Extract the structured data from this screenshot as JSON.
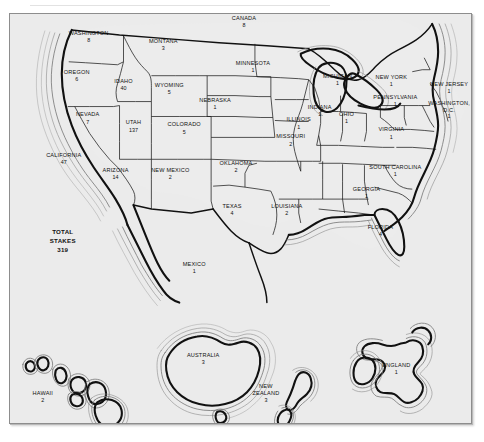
{
  "figure": {
    "type": "map",
    "region_fill": "#ececec",
    "frame_background": "#ebebeb",
    "outline_color": "#111111",
    "total": {
      "line1": "TOTAL",
      "line2": "STAKES",
      "value": "319"
    }
  },
  "regions": [
    {
      "name": "WASHINGTON",
      "value": "8",
      "x": 88,
      "y": 34,
      "lines": 1
    },
    {
      "name": "OREGON",
      "value": "6",
      "x": 76,
      "y": 73,
      "lines": 1
    },
    {
      "name": "IDAHO",
      "value": "40",
      "x": 123,
      "y": 82,
      "lines": 1
    },
    {
      "name": "MONTANA",
      "value": "3",
      "x": 163,
      "y": 42,
      "lines": 1
    },
    {
      "name": "WYOMING",
      "value": "5",
      "x": 169,
      "y": 86,
      "lines": 1
    },
    {
      "name": "NEVADA",
      "value": "7",
      "x": 87,
      "y": 116,
      "lines": 1
    },
    {
      "name": "UTAH",
      "value": "137",
      "x": 133,
      "y": 124,
      "lines": 1
    },
    {
      "name": "COLORADO",
      "value": "5",
      "x": 184,
      "y": 126,
      "lines": 1
    },
    {
      "name": "CALIFORNIA",
      "value": "47",
      "x": 63,
      "y": 157,
      "lines": 1
    },
    {
      "name": "ARIZONA",
      "value": "14",
      "x": 115,
      "y": 172,
      "lines": 1
    },
    {
      "name": "NEW MEXICO",
      "value": "2",
      "x": 170,
      "y": 172,
      "lines": 1
    },
    {
      "name": "NEBRASKA",
      "value": "1",
      "x": 215,
      "y": 101,
      "lines": 1
    },
    {
      "name": "OKLAHOMA",
      "value": "2",
      "x": 236,
      "y": 165,
      "lines": 1
    },
    {
      "name": "TEXAS",
      "value": "4",
      "x": 232,
      "y": 208,
      "lines": 1
    },
    {
      "name": "MINNESOTA",
      "value": "1",
      "x": 253,
      "y": 64,
      "lines": 1
    },
    {
      "name": "MISSOURI",
      "value": "2",
      "x": 291,
      "y": 138,
      "lines": 1
    },
    {
      "name": "ILLINOIS",
      "value": "1",
      "x": 299,
      "y": 121,
      "lines": 1
    },
    {
      "name": "INDIANA",
      "value": "1",
      "x": 320,
      "y": 108,
      "lines": 1
    },
    {
      "name": "OHIO",
      "value": "1",
      "x": 347,
      "y": 115,
      "lines": 1
    },
    {
      "name": "MICHIGAN",
      "value": "1",
      "x": 338,
      "y": 77,
      "lines": 1
    },
    {
      "name": "LOUISIANA",
      "value": "2",
      "x": 287,
      "y": 208,
      "lines": 1
    },
    {
      "name": "NEW YORK",
      "value": "1",
      "x": 392,
      "y": 78,
      "lines": 1
    },
    {
      "name": "PENNSYLVANIA",
      "value": "1",
      "x": 396,
      "y": 98,
      "lines": 1
    },
    {
      "name": "NEW JERSEY",
      "value": "1",
      "x": 450,
      "y": 85,
      "lines": 1
    },
    {
      "name": "VIRGINIA",
      "value": "1",
      "x": 392,
      "y": 131,
      "lines": 1
    },
    {
      "name": "SOUTH CAROLINA",
      "value": "1",
      "x": 396,
      "y": 169,
      "lines": 1
    },
    {
      "name": "GEORGIA",
      "value": "1",
      "x": 367,
      "y": 191,
      "lines": 1
    },
    {
      "name": "FLORIDA",
      "value": "4",
      "x": 381,
      "y": 229,
      "lines": 1
    },
    {
      "name": "CANADA",
      "value": "8",
      "x": 244,
      "y": 19,
      "lines": 1
    },
    {
      "name": "MEXICO",
      "value": "1",
      "x": 194,
      "y": 266,
      "lines": 1
    },
    {
      "name": "HAWAII",
      "value": "2",
      "x": 42,
      "y": 396,
      "lines": 1
    },
    {
      "name": "AUSTRALIA",
      "value": "3",
      "x": 203,
      "y": 358,
      "lines": 1
    },
    {
      "name": "ENGLAND",
      "value": "1",
      "x": 397,
      "y": 368,
      "lines": 1
    }
  ],
  "multiline_regions": [
    {
      "name": "WASHINGTON, D.C.",
      "value": "1",
      "line1": "WASHINGTON,",
      "line2": "D.C.",
      "x": 450,
      "y": 104
    },
    {
      "name": "NEW ZEALAND",
      "value": "3",
      "line1": "NEW",
      "line2": "ZEALAND",
      "x": 266,
      "y": 389
    }
  ]
}
